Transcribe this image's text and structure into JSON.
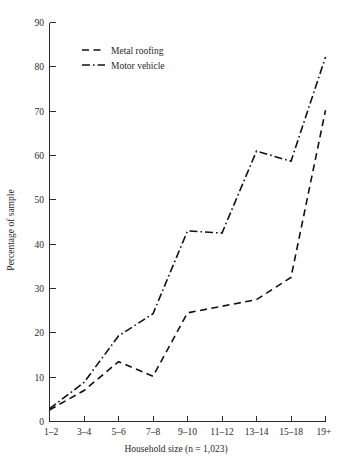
{
  "chart_data": {
    "type": "line",
    "title": "",
    "xlabel": "Household size (n = 1,023)",
    "ylabel": "Percentage of sample",
    "categories": [
      "1–2",
      "3–4",
      "5–6",
      "7–8",
      "9–10",
      "11–12",
      "13–14",
      "15–18",
      "19+"
    ],
    "ylim": [
      0,
      90
    ],
    "yticks": [
      0,
      10,
      20,
      30,
      40,
      50,
      60,
      70,
      80,
      90
    ],
    "ytick_labels": [
      "0",
      "10",
      "20",
      "30",
      "40",
      "50",
      "60",
      "70",
      "80",
      "90"
    ],
    "grid": false,
    "legend_position": "top-left-inside",
    "series": [
      {
        "name": "Metal roofing",
        "style": "dashed",
        "values": [
          2.6,
          7.0,
          13.5,
          10.2,
          24.5,
          26.0,
          27.5,
          32.5,
          70.2
        ]
      },
      {
        "name": "Motor vehicle",
        "style": "dash-dot",
        "values": [
          2.9,
          8.8,
          19.3,
          24.3,
          43.0,
          42.5,
          61.0,
          58.7,
          82.2
        ]
      }
    ]
  },
  "legend": {
    "items": [
      {
        "label": "Metal roofing"
      },
      {
        "label": "Motor vehicle"
      }
    ]
  }
}
